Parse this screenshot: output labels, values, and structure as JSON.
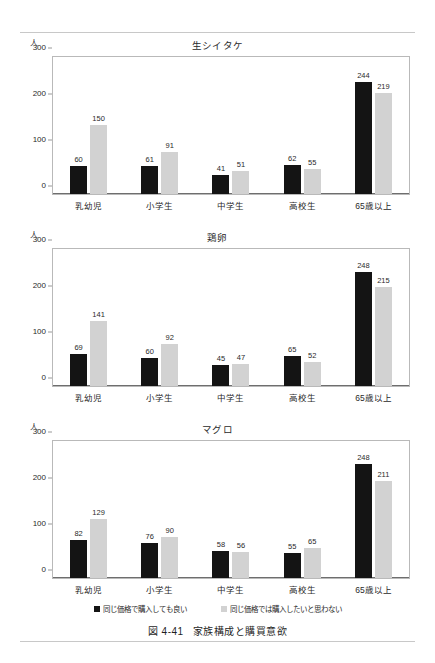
{
  "figure": {
    "caption_number": "図 4-41",
    "caption_title": "家族構成と購買意欲",
    "unit_label": "人"
  },
  "legend": {
    "items": [
      {
        "label": "同じ価格で購入しても良い",
        "color": "#141414",
        "swatch": "dark-square-icon"
      },
      {
        "label": "同じ価格では購入したいと思わない",
        "color": "#d2d2d2",
        "swatch": "light-square-icon"
      }
    ]
  },
  "axis": {
    "yticks": [
      "0",
      "100",
      "200",
      "300"
    ],
    "categories": [
      "乳幼児",
      "小学生",
      "中学生",
      "高校生",
      "65歳以上"
    ]
  },
  "chart_data": [
    {
      "type": "bar",
      "title": "生シイタケ",
      "xlabel": "",
      "ylabel": "人",
      "ylim": [
        0,
        300
      ],
      "yticks": [
        0,
        100,
        200,
        300
      ],
      "grid": false,
      "legend_position": "bottom",
      "categories": [
        "乳幼児",
        "小学生",
        "中学生",
        "高校生",
        "65歳以上"
      ],
      "series": [
        {
          "name": "同じ価格で購入しても良い",
          "color": "#141414",
          "values": [
            60,
            61,
            41,
            62,
            244
          ]
        },
        {
          "name": "同じ価格では購入したいと思わない",
          "color": "#d2d2d2",
          "values": [
            150,
            91,
            51,
            55,
            219
          ]
        }
      ]
    },
    {
      "type": "bar",
      "title": "鶏卵",
      "xlabel": "",
      "ylabel": "人",
      "ylim": [
        0,
        300
      ],
      "yticks": [
        0,
        100,
        200,
        300
      ],
      "grid": false,
      "legend_position": "bottom",
      "categories": [
        "乳幼児",
        "小学生",
        "中学生",
        "高校生",
        "65歳以上"
      ],
      "series": [
        {
          "name": "同じ価格で購入しても良い",
          "color": "#141414",
          "values": [
            69,
            60,
            45,
            65,
            248
          ]
        },
        {
          "name": "同じ価格では購入したいと思わない",
          "color": "#d2d2d2",
          "values": [
            141,
            92,
            47,
            52,
            215
          ]
        }
      ]
    },
    {
      "type": "bar",
      "title": "マグロ",
      "xlabel": "",
      "ylabel": "人",
      "ylim": [
        0,
        300
      ],
      "yticks": [
        0,
        100,
        200,
        300
      ],
      "grid": false,
      "legend_position": "bottom",
      "categories": [
        "乳幼児",
        "小学生",
        "中学生",
        "高校生",
        "65歳以上"
      ],
      "series": [
        {
          "name": "同じ価格で購入しても良い",
          "color": "#141414",
          "values": [
            82,
            76,
            58,
            55,
            248
          ]
        },
        {
          "name": "同じ価格では購入したいと思わない",
          "color": "#d2d2d2",
          "values": [
            129,
            90,
            56,
            65,
            211
          ]
        }
      ]
    }
  ]
}
